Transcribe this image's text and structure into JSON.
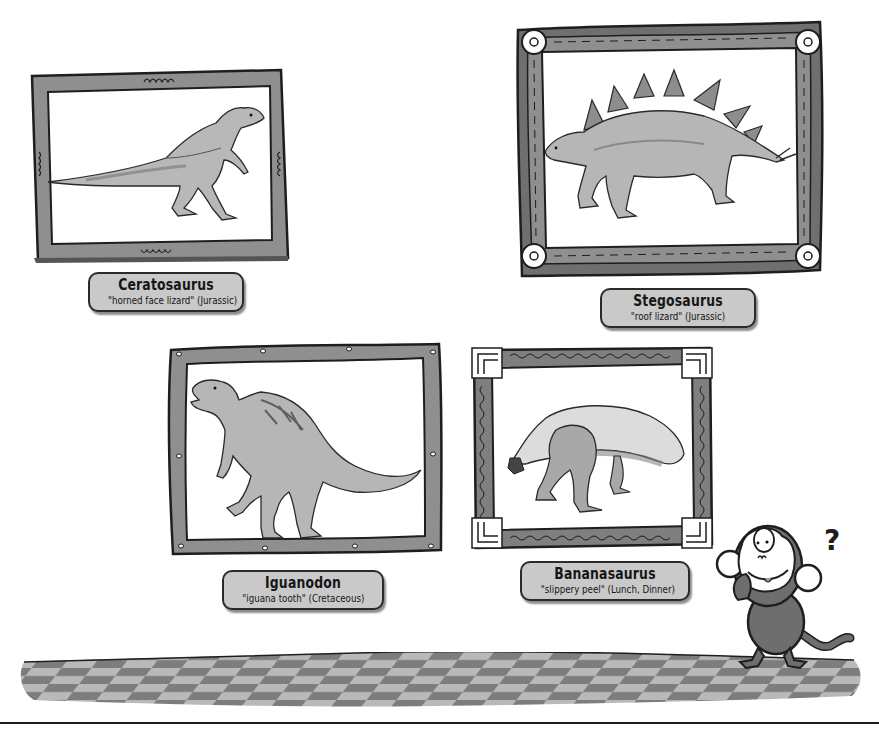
{
  "gallery": {
    "exhibits": [
      {
        "name": "Ceratosaurus",
        "description": "\"horned face lizard\" (Jurassic)",
        "frame_style": "wooden-squiggle"
      },
      {
        "name": "Stegosaurus",
        "description": "\"roof lizard\" (Jurassic)",
        "frame_style": "wooden-bolted-corners"
      },
      {
        "name": "Iguanodon",
        "description": "\"iguana tooth\" (Cretaceous)",
        "frame_style": "wooden-nailed"
      },
      {
        "name": "Bananasaurus",
        "description": "\"slippery peel\" (Lunch, Dinner)",
        "frame_style": "greek-key-corners"
      }
    ],
    "mascot": {
      "character": "monkey",
      "expression": "confused",
      "symbol": "?"
    }
  },
  "colors": {
    "frame_fill": "#8f8f8f",
    "frame_dark": "#6e6e6e",
    "label_fill": "#c9c9c9",
    "outline": "#1e1e1e",
    "floor_light": "#b9b9b9",
    "floor_dark": "#7d7d7d",
    "background": "#ffffff"
  }
}
